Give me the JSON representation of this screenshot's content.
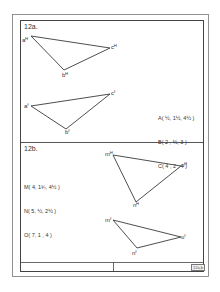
{
  "colors": {
    "line": "#3a3a3a",
    "frame": "#555555",
    "paper": "#ffffff"
  },
  "problem_a": {
    "title": "12a.",
    "horizontal_view": {
      "labels": {
        "a": "aᴴ",
        "b": "bᴴ",
        "c": "cᴴ"
      },
      "points": {
        "a": [
          31,
          36
        ],
        "b": [
          64,
          70
        ],
        "c": [
          110,
          48
        ]
      }
    },
    "frontal_view": {
      "labels": {
        "a": "aᶠ",
        "b": "bᶠ",
        "c": "cᶠ"
      },
      "points": {
        "a": [
          31,
          106
        ],
        "b": [
          66,
          129
        ],
        "c": [
          110,
          94
        ]
      }
    },
    "coordinates": [
      "A( ½, 1½, 4½ )",
      "B( 2 , ½, 3 )",
      "C( 4 , 2 , 4 )"
    ]
  },
  "problem_b": {
    "title": "12b.",
    "coordinates": [
      "M( 4, 1¾, 4½ )",
      "N( 5, ½, 2½ )",
      "O( 7, 1 , 4 )"
    ],
    "horizontal_view": {
      "labels": {
        "m": "mᴴ",
        "n": "nᴴ",
        "o": "oᴴ"
      },
      "points": {
        "m": [
          113,
          155
        ],
        "n": [
          136,
          202
        ],
        "o": [
          181,
          166
        ]
      }
    },
    "frontal_view": {
      "labels": {
        "m": "mᶠ",
        "n": "nᶠ",
        "o": "oᶠ"
      },
      "points": {
        "m": [
          113,
          220
        ],
        "n": [
          137,
          248
        ],
        "o": [
          181,
          237
        ]
      }
    }
  },
  "title_block": {
    "plate_number": "12a,b"
  }
}
